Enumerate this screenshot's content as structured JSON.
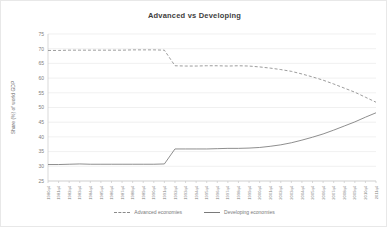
{
  "chart_data": {
    "type": "line",
    "title": "Advanced vs Developing",
    "xlabel": "",
    "ylabel": "Share (%) of world GDP",
    "ylim": [
      25,
      75
    ],
    "ytick_step": 5,
    "yticks": [
      25,
      30,
      35,
      40,
      45,
      50,
      55,
      60,
      65,
      70,
      75
    ],
    "grid": true,
    "legend_position": "bottom",
    "categories": [
      "1980q4",
      "1981q4",
      "1982q4",
      "1983q4",
      "1984q4",
      "1985q4",
      "1986q4",
      "1987q4",
      "1988q4",
      "1989q4",
      "1990q4",
      "1991q4",
      "1992q4",
      "1993q4",
      "1994q4",
      "1995q4",
      "1996q4",
      "1997q4",
      "1998q4",
      "1999q4",
      "2000q4",
      "2001q4",
      "2002q4",
      "2003q4",
      "2004q4",
      "2005q4",
      "2006q4",
      "2007q4",
      "2008q4",
      "2009q4",
      "2010q4",
      "2011q4"
    ],
    "series": [
      {
        "name": "Advanced economies",
        "style": "dashed",
        "color": "#8a8a8a",
        "values": [
          69.4,
          69.4,
          69.5,
          69.5,
          69.5,
          69.5,
          69.5,
          69.5,
          69.6,
          69.6,
          69.6,
          69.5,
          64.2,
          64.1,
          64.1,
          64.2,
          64.2,
          64.1,
          64.2,
          64.1,
          63.8,
          63.4,
          62.9,
          62.3,
          61.4,
          60.4,
          59.3,
          58.0,
          56.6,
          55.2,
          53.5,
          51.8
        ]
      },
      {
        "name": "Developing economies",
        "style": "solid",
        "color": "#7a7a7a",
        "values": [
          30.6,
          30.6,
          30.7,
          30.8,
          30.7,
          30.7,
          30.7,
          30.7,
          30.7,
          30.7,
          30.7,
          30.8,
          35.9,
          35.9,
          35.9,
          35.9,
          36.0,
          36.1,
          36.1,
          36.2,
          36.4,
          36.8,
          37.3,
          38.0,
          38.9,
          39.9,
          41.0,
          42.3,
          43.7,
          45.1,
          46.7,
          48.2
        ]
      }
    ]
  },
  "legend": {
    "items": [
      {
        "label": "Advanced economies",
        "style": "dashed"
      },
      {
        "label": "Developing economies",
        "style": "solid"
      }
    ]
  }
}
